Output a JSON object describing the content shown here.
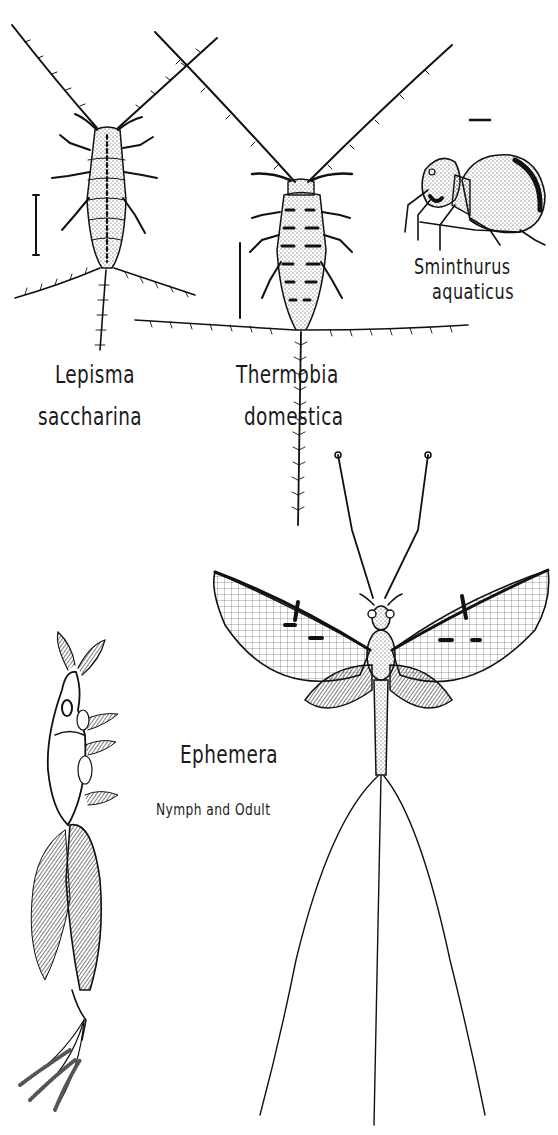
{
  "plate": {
    "background": "#ffffff",
    "ink": "#111111",
    "specimens": [
      {
        "id": "lepisma",
        "genus": "Lepisma",
        "species": "saccharina"
      },
      {
        "id": "thermobia",
        "genus": "Thermobia",
        "species": "domestica"
      },
      {
        "id": "sminthurus",
        "genus": "Sminthurus",
        "species": "aquaticus"
      },
      {
        "id": "ephemera",
        "genus": "Ephemera",
        "caption": "Nymph and Odult"
      }
    ]
  },
  "labels": {
    "lepisma_genus": "Lepisma",
    "lepisma_species": "saccharina",
    "thermobia_genus": "Thermobia",
    "thermobia_species": "domestica",
    "sminthurus_genus": "Sminthurus",
    "sminthurus_species": "aquaticus",
    "ephemera_genus": "Ephemera",
    "ephemera_caption": "Nymph and Odult"
  }
}
